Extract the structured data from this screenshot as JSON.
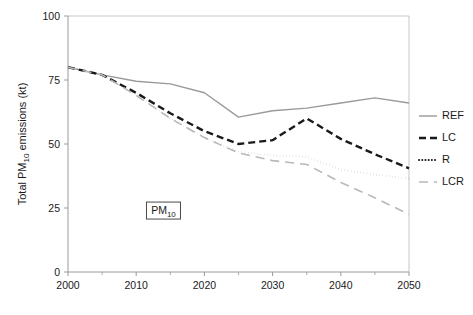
{
  "chart_data": {
    "type": "line",
    "title": "",
    "subtitle": "",
    "xlabel": "",
    "ylabel": "Total PM10 emissions (kt)",
    "ylabel_parts": {
      "pre": "Total PM",
      "sub": "10",
      "post": " emissions (kt)"
    },
    "x": [
      2000,
      2005,
      2010,
      2015,
      2020,
      2025,
      2030,
      2035,
      2040,
      2045,
      2050
    ],
    "xlim": [
      2000,
      2050
    ],
    "ylim": [
      0,
      100
    ],
    "xticks": [
      2000,
      2010,
      2020,
      2030,
      2040,
      2050
    ],
    "xticklabels": [
      "2000",
      "2010",
      "2020",
      "2030",
      "2040",
      "2050"
    ],
    "xminorticks": [
      2005,
      2015,
      2025,
      2035,
      2045
    ],
    "yticks": [
      0,
      25,
      50,
      75,
      100
    ],
    "yticklabels": [
      "0",
      "25",
      "50",
      "75",
      "100"
    ],
    "grid": false,
    "legend_position": "right",
    "series": [
      {
        "name": "REF",
        "values": [
          80,
          77,
          74.5,
          73.5,
          70,
          60.5,
          63,
          64,
          66,
          68,
          66
        ],
        "color": "#9a9a9a",
        "style": "solid",
        "width": 1.4
      },
      {
        "name": "LC",
        "values": [
          80,
          77,
          70,
          62,
          55,
          50,
          51.5,
          60,
          52,
          46,
          40.5
        ],
        "color": "#1a1a1a",
        "style": "dashed",
        "width": 2.4
      },
      {
        "name": "R",
        "values": [
          80,
          77,
          69,
          60,
          52.5,
          47,
          45.5,
          45,
          40,
          38,
          36.5
        ],
        "color": "#1a1a1a",
        "style": "dotted",
        "width": 2.0
      },
      {
        "name": "LCR",
        "values": [
          80,
          77,
          69,
          60,
          52.5,
          46.5,
          43.5,
          42,
          35,
          29,
          22.5
        ],
        "color": "#b8b8b8",
        "style": "longdash",
        "width": 1.6
      }
    ],
    "annotations": [
      {
        "name": "pm10-box",
        "text": "PM10",
        "text_pre": "PM",
        "text_sub": "10",
        "x": 2014,
        "y": 24
      }
    ]
  },
  "legend": {
    "items": [
      {
        "label": "REF"
      },
      {
        "label": "LC"
      },
      {
        "label": "R"
      },
      {
        "label": "LCR"
      }
    ]
  }
}
